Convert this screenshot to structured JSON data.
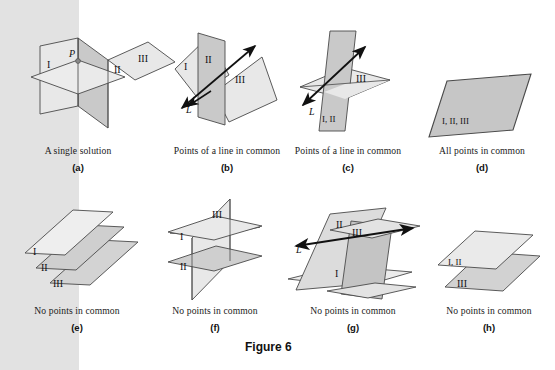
{
  "figure": {
    "label": "Figure 6",
    "background_band_color": "#e2e2e2",
    "plane_light_fill": "#e8e8e8",
    "plane_mid_fill": "#c9c9c9",
    "plane_dark_fill": "#b3b3b3",
    "stroke_color": "#4a4a4a"
  },
  "panels": [
    {
      "key": "a",
      "caption": "A single solution",
      "sublabel": "(a)",
      "plane_labels": [
        "I",
        "II",
        "III"
      ],
      "point_label": "P",
      "line_label": ""
    },
    {
      "key": "b",
      "caption": "Points of a line in common",
      "sublabel": "(b)",
      "plane_labels": [
        "I",
        "II",
        "III"
      ],
      "point_label": "",
      "line_label": "L"
    },
    {
      "key": "c",
      "caption": "Points of a line in common",
      "sublabel": "(c)",
      "plane_labels": [
        "I, II",
        "III"
      ],
      "point_label": "",
      "line_label": "L"
    },
    {
      "key": "d",
      "caption": "All points in common",
      "sublabel": "(d)",
      "plane_labels": [
        "I, II, III"
      ],
      "point_label": "",
      "line_label": ""
    },
    {
      "key": "e",
      "caption": "No points in common",
      "sublabel": "(e)",
      "plane_labels": [
        "I",
        "II",
        "III"
      ],
      "point_label": "",
      "line_label": ""
    },
    {
      "key": "f",
      "caption": "No points in common",
      "sublabel": "(f)",
      "plane_labels": [
        "I",
        "II",
        "III"
      ],
      "point_label": "",
      "line_label": ""
    },
    {
      "key": "g",
      "caption": "No points in common",
      "sublabel": "(g)",
      "plane_labels": [
        "I",
        "II",
        "III"
      ],
      "point_label": "",
      "line_label": "L"
    },
    {
      "key": "h",
      "caption": "No points in common",
      "sublabel": "(h)",
      "plane_labels": [
        "I, II",
        "III"
      ],
      "point_label": "",
      "line_label": ""
    }
  ],
  "labels": {
    "a_I": "I",
    "a_II": "II",
    "a_III": "III",
    "a_P": "P",
    "b_I": "I",
    "b_II": "II",
    "b_III": "III",
    "b_L": "L",
    "c_I_II": "I, II",
    "c_III": "III",
    "c_L": "L",
    "d_all": "I, II, III",
    "e_I": "I",
    "e_II": "II",
    "e_III": "III",
    "f_I": "I",
    "f_II": "II",
    "f_III": "III",
    "g_I": "I",
    "g_II": "II",
    "g_III": "III",
    "g_L": "L",
    "h_I_II": "I, II",
    "h_III": "III"
  }
}
